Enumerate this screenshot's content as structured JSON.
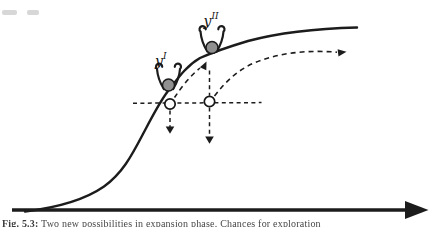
{
  "figure": {
    "state_labels": [
      {
        "base": "y",
        "sup": "I"
      },
      {
        "base": "y",
        "sup": "II"
      }
    ],
    "caption": {
      "label": "Fig. 5.3:",
      "text": "Two new possibilities in expansion phase. Chances for exploration"
    },
    "colors": {
      "ink": "#1c1c1c",
      "ball_fill": "#909090",
      "background": "#ffffff"
    }
  }
}
